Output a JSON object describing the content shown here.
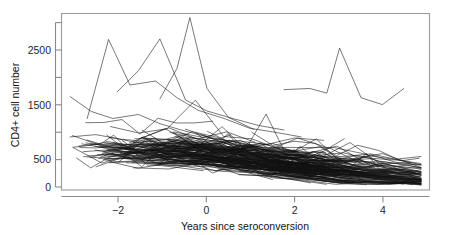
{
  "figure": {
    "kind": "spaghetti-plot",
    "background_color": "#ffffff",
    "line_color": "#111111",
    "axis_color": "#8a8a8a"
  },
  "chart_data": {
    "type": "line",
    "title": "",
    "subtitle": "",
    "xlabel": "Years since seroconversion",
    "ylabel": "CD4+ cell number",
    "xlim": [
      -3.2,
      5.4
    ],
    "ylim": [
      -60,
      3000
    ],
    "grid": false,
    "legend": null,
    "x_ticks": [
      -2,
      0,
      2,
      4
    ],
    "x_tick_labels": [
      "−2",
      "0",
      "2",
      "4"
    ],
    "y_ticks": [
      0,
      500,
      1000,
      1500,
      2000,
      2500,
      3000
    ],
    "y_tick_labels": [
      "0",
      "500",
      "",
      "1500",
      "",
      "2500",
      ""
    ],
    "y_labeled_ticks": [
      0,
      500,
      1500,
      2500
    ],
    "n_series": 250,
    "series_note": "Each polyline is one subject's repeated CD4+ counts over years since seroconversion.",
    "annotations": [
      {
        "label": "tall spike near seroconversion",
        "x": -0.2,
        "y": 2900
      },
      {
        "label": "late high trajectory",
        "x": 3.3,
        "y": 2400
      }
    ],
    "series": [
      {
        "name": "s1",
        "x": [
          -3.0,
          -2.5,
          -2.0,
          -1.4,
          -0.9,
          -0.4,
          0.1,
          0.7,
          1.3,
          1.9
        ],
        "values": [
          1560,
          1300,
          1180,
          1250,
          1090,
          980,
          880,
          790,
          700,
          660
        ]
      },
      {
        "name": "s2",
        "x": [
          -2.6,
          -2.1,
          -1.6,
          -1.0,
          -0.5,
          0.0,
          0.6,
          1.2,
          1.8,
          2.4
        ],
        "values": [
          1180,
          2550,
          1760,
          1830,
          1540,
          1320,
          1180,
          1010,
          940,
          860
        ]
      },
      {
        "name": "s3",
        "x": [
          -1.9,
          -1.4,
          -0.9,
          -0.3,
          0.2,
          0.8,
          1.4,
          2.0
        ],
        "values": [
          1640,
          2010,
          2560,
          1500,
          1310,
          1180,
          1060,
          980
        ]
      },
      {
        "name": "s4",
        "x": [
          -0.9,
          -0.5,
          -0.2,
          0.2,
          0.7,
          1.3
        ],
        "values": [
          1520,
          2050,
          2930,
          1700,
          1200,
          990
        ]
      },
      {
        "name": "s5",
        "x": [
          2.0,
          2.6,
          3.0,
          3.3,
          3.8,
          4.3,
          4.8
        ],
        "values": [
          1680,
          1700,
          1620,
          2400,
          1540,
          1420,
          1700
        ]
      },
      {
        "name": "s6",
        "x": [
          -3.0,
          -2.4,
          -1.8,
          -1.2,
          -0.6,
          0.0,
          0.6,
          1.2,
          1.8,
          2.4,
          3.0
        ],
        "values": [
          860,
          900,
          820,
          780,
          820,
          700,
          640,
          600,
          560,
          540,
          500
        ]
      },
      {
        "name": "s7",
        "x": [
          -2.8,
          -2.2,
          -1.6,
          -1.0,
          -0.4,
          0.2,
          0.8,
          1.4,
          2.0,
          2.6,
          3.2,
          3.8
        ],
        "values": [
          700,
          760,
          690,
          720,
          660,
          600,
          560,
          540,
          500,
          470,
          450,
          420
        ]
      }
    ]
  },
  "axes": {
    "y_title": "CD4+ cell number",
    "x_title": "Years since seroconversion",
    "x_tick_labels": [
      "−2",
      "0",
      "2",
      "4"
    ],
    "y_tick_labels": [
      "2500",
      "1500",
      "500",
      "0"
    ]
  }
}
